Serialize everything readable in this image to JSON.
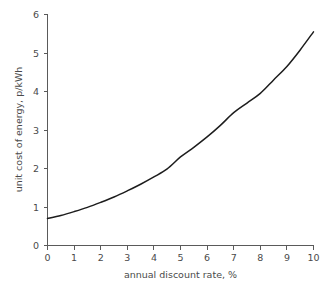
{
  "chart_data": {
    "type": "line",
    "title": "",
    "subtitle": "",
    "xlabel": "annual discount rate, %",
    "ylabel": "unit cost of energy, p/kWh",
    "xlim": [
      0,
      10
    ],
    "ylim": [
      0,
      6
    ],
    "xticks": [
      0,
      1,
      2,
      3,
      4,
      5,
      6,
      7,
      8,
      9,
      10
    ],
    "yticks": [
      0,
      1,
      2,
      3,
      4,
      5,
      6
    ],
    "xtick_labels": [
      "0",
      "1",
      "2",
      "3",
      "4",
      "5",
      "6",
      "7",
      "8",
      "9",
      "10"
    ],
    "ytick_labels": [
      "0",
      "1",
      "2",
      "3",
      "4",
      "5",
      "6"
    ],
    "grid": false,
    "legend": null,
    "legend_position": "none",
    "annotations": [],
    "series": [
      {
        "name": "unit cost of energy",
        "color": "#1d1d1d",
        "x": [
          0,
          0.5,
          1,
          1.5,
          2,
          2.5,
          3,
          3.5,
          4,
          4.5,
          5,
          5.5,
          6,
          6.5,
          7,
          7.5,
          8,
          8.5,
          9,
          9.5,
          10
        ],
        "values": [
          0.7,
          0.78,
          0.88,
          0.99,
          1.12,
          1.26,
          1.42,
          1.59,
          1.78,
          1.99,
          2.3,
          2.55,
          2.82,
          3.12,
          3.45,
          3.7,
          3.95,
          4.3,
          4.65,
          5.08,
          5.55
        ]
      }
    ]
  },
  "axes": {
    "x_axis_name": "annual-discount-rate-axis",
    "y_axis_name": "unit-cost-axis"
  }
}
